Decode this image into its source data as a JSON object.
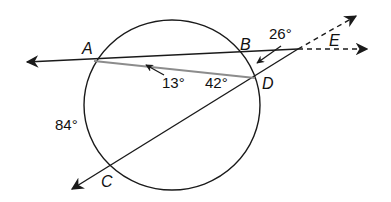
{
  "diagram": {
    "type": "circle-secants-geometry",
    "colors": {
      "stroke": "#1a1a1a",
      "chord": "#8c8c8c",
      "background": "#ffffff"
    },
    "points": {
      "A": "A",
      "B": "B",
      "C": "C",
      "D": "D",
      "E": "E"
    },
    "measures": {
      "angle_ADE_arrow": "13°",
      "angle_ADC": "42°",
      "angle_E": "26°",
      "arc_AC": "84°"
    }
  }
}
